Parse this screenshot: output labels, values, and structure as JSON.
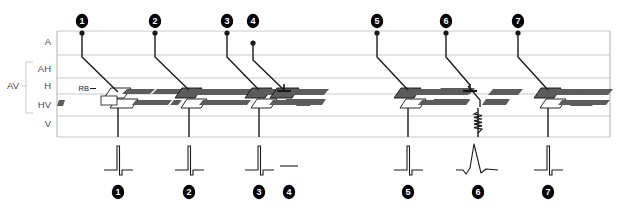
{
  "figure": {
    "type": "ladder-diagram",
    "title": "",
    "width": 620,
    "height": 212,
    "background": "#ffffff"
  },
  "colors": {
    "grid": "#c9c9c9",
    "frame": "#b0b0b0",
    "line": "#1a1a1a",
    "bundle_dark": "#5c5c5c",
    "bundle_mid": "#8a8a8a",
    "bundle_light": "#b5b5b5",
    "marker_fill": "#000000",
    "marker_text": "#ffffff",
    "axis_text": "#4a4a4a"
  },
  "axis": {
    "name": "conduction-levels",
    "labels": [
      {
        "id": "A",
        "text": "A",
        "y": 42
      },
      {
        "id": "AH",
        "text": "AH",
        "y": 69
      },
      {
        "id": "H",
        "text": "H",
        "y": 86
      },
      {
        "id": "HV",
        "text": "HV",
        "y": 105
      },
      {
        "id": "V",
        "text": "V",
        "y": 124
      }
    ],
    "bracket": {
      "text": "AV",
      "label_y": 86,
      "top": 62,
      "bottom": 113
    },
    "gridlines_y": [
      31,
      55,
      78,
      94,
      116,
      137
    ],
    "frame": {
      "x": 57,
      "y": 31,
      "width": 553,
      "height": 106
    }
  },
  "bundle_branch_labels": [
    {
      "id": "RB",
      "text": "RB",
      "x": 89,
      "y": 91
    },
    {
      "id": "LB",
      "text": "LB",
      "x": 111,
      "y": 103
    }
  ],
  "beats": [
    {
      "id": 1,
      "label": "1",
      "top_marker_x": 82,
      "top_marker_y": 21,
      "atrial_dot_y": 33,
      "atrial_dot": true,
      "av_slope": {
        "x1": 82,
        "y1": 33,
        "x2": 82,
        "y2": 57,
        "x3": 118,
        "y3": 92
      },
      "ventricular_line": {
        "x": 118,
        "y1": 108,
        "y2": 137
      },
      "bundle_style": "normal-rb-lb",
      "block_marker": false,
      "slow_conduction": false,
      "ecg": {
        "x": 118,
        "label": "1",
        "morphology": "narrow-qrs"
      }
    },
    {
      "id": 2,
      "label": "2",
      "top_marker_x": 155,
      "top_marker_y": 21,
      "atrial_dot_y": 33,
      "atrial_dot": true,
      "av_slope": {
        "x1": 155,
        "y1": 33,
        "x2": 155,
        "y2": 57,
        "x3": 189,
        "y3": 90
      },
      "ventricular_line": {
        "x": 189,
        "y1": 108,
        "y2": 137
      },
      "bundle_style": "normal",
      "block_marker": false,
      "slow_conduction": false,
      "ecg": {
        "x": 189,
        "label": "2",
        "morphology": "narrow-qrs"
      }
    },
    {
      "id": 3,
      "label": "3",
      "top_marker_x": 227,
      "top_marker_y": 21,
      "atrial_dot_y": 33,
      "atrial_dot": true,
      "av_slope": {
        "x1": 227,
        "y1": 33,
        "x2": 227,
        "y2": 57,
        "x3": 259,
        "y3": 90
      },
      "ventricular_line": {
        "x": 259,
        "y1": 108,
        "y2": 137
      },
      "bundle_style": "normal",
      "block_marker": false,
      "slow_conduction": false,
      "ecg": {
        "x": 259,
        "label": "3",
        "morphology": "narrow-qrs"
      }
    },
    {
      "id": 4,
      "label": "4",
      "top_marker_x": 253,
      "top_marker_y": 21,
      "atrial_dot_y": 43,
      "atrial_dot": true,
      "av_slope": {
        "x1": 253,
        "y1": 43,
        "x2": 253,
        "y2": 60,
        "x3": 284,
        "y3": 90
      },
      "ventricular_line": null,
      "bundle_style": "blocked",
      "block_marker": true,
      "block_marker_x": 284,
      "slow_conduction": false,
      "ecg": {
        "x": 289,
        "label": "4",
        "morphology": "flat"
      }
    },
    {
      "id": 5,
      "label": "5",
      "top_marker_x": 377,
      "top_marker_y": 21,
      "atrial_dot_y": 33,
      "atrial_dot": true,
      "av_slope": {
        "x1": 377,
        "y1": 33,
        "x2": 377,
        "y2": 57,
        "x3": 408,
        "y3": 90
      },
      "ventricular_line": {
        "x": 408,
        "y1": 108,
        "y2": 137
      },
      "bundle_style": "normal",
      "block_marker": false,
      "slow_conduction": false,
      "ecg": {
        "x": 408,
        "label": "5",
        "morphology": "narrow-qrs"
      }
    },
    {
      "id": 6,
      "label": "6",
      "top_marker_x": 446,
      "top_marker_y": 21,
      "atrial_dot_y": 33,
      "atrial_dot": true,
      "av_slope": {
        "x1": 446,
        "y1": 33,
        "x2": 446,
        "y2": 57,
        "x3": 470,
        "y3": 85
      },
      "ventricular_line": {
        "x": 478,
        "y1": 108,
        "y2": 137
      },
      "bundle_style": "blocked-slow",
      "block_marker": true,
      "block_marker_x": 470,
      "slow_conduction": true,
      "slow_conduction_x": 478,
      "ecg": {
        "x": 478,
        "label": "6",
        "morphology": "wide-qrs"
      }
    },
    {
      "id": 7,
      "label": "7",
      "top_marker_x": 518,
      "top_marker_y": 21,
      "atrial_dot_y": 33,
      "atrial_dot": true,
      "av_slope": {
        "x1": 518,
        "y1": 33,
        "x2": 518,
        "y2": 57,
        "x3": 548,
        "y3": 90
      },
      "ventricular_line": {
        "x": 548,
        "y1": 108,
        "y2": 137
      },
      "bundle_style": "normal",
      "block_marker": false,
      "slow_conduction": false,
      "ecg": {
        "x": 548,
        "label": "7",
        "morphology": "narrow-qrs"
      }
    }
  ],
  "ecg_row": {
    "name": "ecg-strip",
    "baseline_y": 170,
    "bottom_marker_y": 192
  }
}
